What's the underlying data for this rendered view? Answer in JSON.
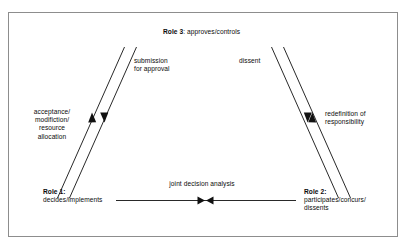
{
  "diagram": {
    "type": "role-relationship-flow",
    "background_color": "#ffffff",
    "frame_color": "#8d8d8d",
    "line_color": "#111111",
    "nodes": {
      "role3": {
        "title": "Role 3",
        "separator": ": ",
        "description": "approves/controls",
        "full_label": "Role 3: approves/controls",
        "position": "top-center"
      },
      "role1": {
        "title": "Role 1:",
        "description": "decides/implements",
        "position": "bottom-left"
      },
      "role2": {
        "title": "Role 2:",
        "description": "participates/concurs/\ndissents",
        "position": "bottom-right"
      }
    },
    "edge_labels": {
      "submission": "submission\nfor approval",
      "acceptance": "acceptance/\nmodifiction/\nresource\nallocation",
      "dissent": "dissent",
      "redefinition": "redefinition of\nresponsibility",
      "joint": "joint decision analysis"
    },
    "connectors": [
      {
        "name": "role1-to-role3",
        "from": "role1",
        "to": "role3",
        "direction": "up",
        "label": "submission for approval"
      },
      {
        "name": "role3-to-role1",
        "from": "role3",
        "to": "role1",
        "direction": "down",
        "label": "acceptance/modifiction/resource allocation"
      },
      {
        "name": "role2-to-role3",
        "from": "role2",
        "to": "role3",
        "direction": "up",
        "label": "dissent"
      },
      {
        "name": "role3-to-role2",
        "from": "role3",
        "to": "role2",
        "direction": "down",
        "label": "redefinition of responsibility"
      },
      {
        "name": "role1-role2-bidirectional",
        "from": "role1",
        "to": "role2",
        "direction": "bidirectional",
        "label": "joint decision analysis"
      }
    ]
  }
}
